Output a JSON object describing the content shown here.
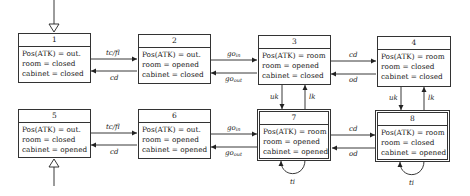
{
  "states": [
    {
      "id": "1",
      "pos": "Pos(ATK) = out.",
      "room": "room = closed",
      "cabinet": "cabinet = closed",
      "initial": true,
      "final": false
    },
    {
      "id": "2",
      "pos": "Pos(ATK) = out.",
      "room": "room = opened",
      "cabinet": "cabinet = closed",
      "initial": false,
      "final": false
    },
    {
      "id": "3",
      "pos": "Pos(ATK) = room",
      "room": "room = opened",
      "cabinet": "cabinet = closed",
      "initial": false,
      "final": false
    },
    {
      "id": "4",
      "pos": "Pos(ATK) = room",
      "room": "room = closed",
      "cabinet": "cabinet = closed",
      "initial": false,
      "final": false
    },
    {
      "id": "5",
      "pos": "Pos(ATK) = out.",
      "room": "room = closed",
      "cabinet": "cabinet = opened",
      "initial": true,
      "final": false
    },
    {
      "id": "6",
      "pos": "Pos(ATK) = out.",
      "room": "room = opened",
      "cabinet": "cabinet = opened",
      "initial": false,
      "final": false
    },
    {
      "id": "7",
      "pos": "Pos(ATK) = room",
      "room": "room = opened",
      "cabinet": "cabinet = opened",
      "initial": false,
      "final": true
    },
    {
      "id": "8",
      "pos": "Pos(ATK) = room",
      "room": "room = closed",
      "cabinet": "cabinet = opened",
      "initial": false,
      "final": true
    }
  ],
  "transitions": {
    "t1_2": "tc/fl",
    "t2_1": "cd",
    "t2_3_base": "go",
    "t2_3_sub": "in",
    "t3_2_base": "go",
    "t3_2_sub": "out",
    "t3_4": "cd",
    "t4_3": "od",
    "t5_6": "tc/fl",
    "t6_5": "cd",
    "t6_7_base": "go",
    "t6_7_sub": "in",
    "t7_6_base": "go",
    "t7_6_sub": "out",
    "t7_8": "cd",
    "t8_7": "od",
    "t3_7": "uk",
    "t7_3": "lk",
    "t4_8": "uk",
    "t8_4": "lk",
    "t7_7": "ti",
    "t8_8": "ti"
  }
}
